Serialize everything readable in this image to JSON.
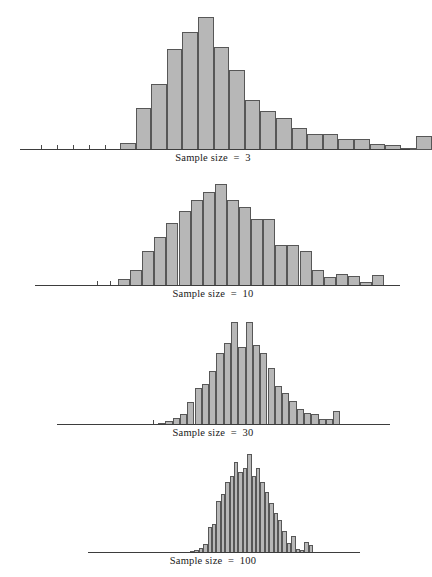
{
  "figure": {
    "width": 426,
    "height": 577,
    "background": "#ffffff",
    "bar_fill": "#b7b7b7",
    "bar_stroke": "#575757",
    "axis_color": "#3d3d3d",
    "text_color": "#1a1a1a"
  },
  "captions": {
    "panel1": "Sample size  =  3",
    "panel2": "Sample size  =  10",
    "panel3": "Sample size  =  30",
    "panel4": "Sample size  =  100"
  },
  "chart_data": [
    {
      "type": "bar",
      "title": "Sample size  =  3",
      "xlabel": "",
      "ylabel": "",
      "grid": false,
      "legend": "none",
      "axis_x_range_px": [
        20,
        410
      ],
      "baseline_y_px": 148,
      "bar_width_px": 15.6,
      "bar_origin_x_px": 120,
      "values": [
        6,
        34,
        54,
        82,
        96,
        108,
        84,
        65,
        41,
        32,
        26,
        18,
        13,
        13,
        9,
        9,
        5,
        4,
        2,
        11
      ],
      "ymax": 122,
      "ticks_px": [
        41,
        57,
        73,
        89,
        105
      ],
      "n_bars": 20
    },
    {
      "type": "bar",
      "title": "Sample size  =  10",
      "xlabel": "",
      "ylabel": "",
      "grid": false,
      "legend": "none",
      "axis_x_range_px": [
        35,
        400
      ],
      "baseline_y_px": 284,
      "bar_width_px": 12.1,
      "bar_origin_x_px": 118,
      "values": [
        7,
        16,
        36,
        50,
        64,
        76,
        88,
        96,
        104,
        88,
        80,
        68,
        68,
        42,
        42,
        36,
        16,
        9,
        12,
        10,
        4,
        11
      ],
      "ymax": 118,
      "ticks_px": [
        97,
        110
      ],
      "n_bars": 22
    },
    {
      "type": "bar",
      "title": "Sample size  =  30",
      "xlabel": "",
      "ylabel": "",
      "grid": false,
      "legend": "none",
      "axis_x_range_px": [
        57,
        390
      ],
      "baseline_y_px": 424,
      "bar_width_px": 7.3,
      "bar_origin_x_px": 158,
      "values": [
        2,
        4,
        7,
        11,
        22,
        36,
        40,
        53,
        70,
        80,
        100,
        76,
        100,
        78,
        70,
        56,
        38,
        31,
        23,
        16,
        12,
        11,
        6,
        6,
        14
      ],
      "ymax": 112,
      "ticks_px": [
        153
      ],
      "n_bars": 25
    },
    {
      "type": "bar",
      "title": "Sample size  =  100",
      "xlabel": "",
      "ylabel": "",
      "grid": false,
      "legend": "none",
      "axis_x_range_px": [
        88,
        360
      ],
      "baseline_y_px": 552,
      "bar_width_px": 4.4,
      "bar_origin_x_px": 190,
      "values": [
        2,
        3,
        5,
        9,
        26,
        29,
        52,
        60,
        72,
        78,
        92,
        82,
        86,
        100,
        78,
        86,
        72,
        62,
        50,
        40,
        33,
        22,
        10,
        17,
        4,
        3,
        11,
        8
      ],
      "ymax": 112,
      "ticks_px": [],
      "n_bars": 28
    }
  ]
}
